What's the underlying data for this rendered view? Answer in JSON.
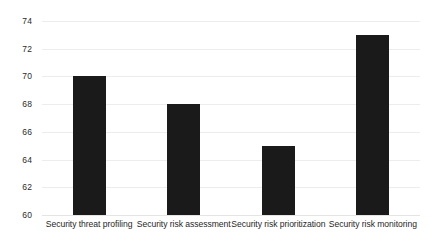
{
  "chart_data": {
    "type": "bar",
    "title": "",
    "subtitle": "",
    "xlabel": "",
    "ylabel": "",
    "categories": [
      "Security threat profiling",
      "Security risk assessment",
      "Security risk prioritization",
      "Security risk monitoring"
    ],
    "values": [
      70,
      68,
      65,
      73
    ],
    "ylim": [
      60,
      74
    ],
    "ytick_labels": [
      "60",
      "62",
      "64",
      "66",
      "68",
      "70",
      "72",
      "74"
    ],
    "ytick_values": [
      60,
      62,
      64,
      66,
      68,
      70,
      72,
      74
    ],
    "grid": true,
    "grid_axis": "y",
    "legend": false,
    "legend_position": "none",
    "bar_color": "#1a1a1a",
    "grid_color": "#ededed",
    "background_color": "#ffffff",
    "text_color": "#1f1f1f"
  }
}
